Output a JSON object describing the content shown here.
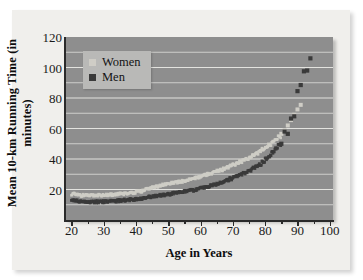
{
  "figure": {
    "background_color": "#ffffff",
    "card_color": "#f0efec",
    "panel_color": "#8e8e8e",
    "gridline_color": "#e8e8e4"
  },
  "legend": {
    "position": "upper-left-inside",
    "entries": [
      {
        "label": "Women",
        "color": "#cfcdc6",
        "marker": "square"
      },
      {
        "label": "Men",
        "color": "#3a3a3a",
        "marker": "square"
      }
    ]
  },
  "axes": {
    "y_ticklabels": [
      "120",
      "100",
      "80",
      "60",
      "40",
      "20"
    ],
    "x_ticklabels": [
      "20",
      "30",
      "40",
      "50",
      "60",
      "70",
      "80",
      "90",
      "100"
    ]
  },
  "chart_data": {
    "type": "scatter",
    "title": "",
    "subtitle": "",
    "xlabel": "Age in Years",
    "ylabel": "Mean 10-km Running Time (in minutes)",
    "xlim": [
      18,
      101
    ],
    "ylim": [
      0,
      120
    ],
    "xticks": [
      20,
      30,
      40,
      50,
      60,
      70,
      80,
      90,
      100
    ],
    "xminorticks": [
      25,
      35,
      45,
      55,
      65,
      75,
      85,
      95
    ],
    "yticks": [
      20,
      40,
      60,
      80,
      100,
      120
    ],
    "ygridlines": [
      10,
      20,
      30,
      40,
      50,
      60,
      70,
      80,
      90,
      100,
      110
    ],
    "grid": "horizontal-white",
    "legend_position": "upper left",
    "series": [
      {
        "name": "Women",
        "color": "#cfcdc6",
        "marker": "square",
        "x": [
          20,
          21,
          22,
          23,
          24,
          25,
          26,
          27,
          28,
          29,
          30,
          31,
          32,
          33,
          34,
          35,
          36,
          37,
          38,
          39,
          40,
          41,
          42,
          43,
          44,
          45,
          46,
          47,
          48,
          49,
          50,
          51,
          52,
          53,
          54,
          55,
          56,
          57,
          58,
          59,
          60,
          61,
          62,
          63,
          64,
          65,
          66,
          67,
          68,
          69,
          70,
          71,
          72,
          73,
          74,
          75,
          76,
          77,
          78,
          79,
          80,
          81,
          82,
          83,
          84,
          85,
          86,
          87,
          88,
          89,
          90,
          91
        ],
        "y": [
          17.0,
          16.6,
          16.3,
          16.2,
          16.1,
          16.0,
          16.0,
          16.1,
          16.2,
          16.2,
          16.3,
          16.4,
          16.5,
          16.7,
          16.9,
          17.0,
          17.2,
          17.4,
          17.7,
          18.0,
          18.4,
          18.9,
          19.5,
          20.1,
          20.8,
          21.5,
          22.1,
          22.6,
          23.0,
          23.4,
          23.8,
          24.2,
          24.6,
          25.0,
          25.4,
          25.8,
          26.3,
          26.9,
          27.5,
          28.1,
          28.8,
          29.4,
          30.0,
          30.6,
          31.3,
          32.0,
          32.8,
          33.7,
          34.6,
          35.6,
          36.6,
          37.5,
          38.3,
          39.2,
          40.2,
          41.3,
          42.5,
          43.8,
          45.2,
          46.6,
          48.0,
          49.5,
          51.0,
          52.6,
          54.5,
          56.5,
          59.0,
          62.0,
          65.5,
          69.0,
          72.5,
          75.5
        ]
      },
      {
        "name": "Men",
        "color": "#3a3a3a",
        "marker": "square",
        "x": [
          20,
          21,
          22,
          23,
          24,
          25,
          26,
          27,
          28,
          29,
          30,
          31,
          32,
          33,
          34,
          35,
          36,
          37,
          38,
          39,
          40,
          41,
          42,
          43,
          44,
          45,
          46,
          47,
          48,
          49,
          50,
          51,
          52,
          53,
          54,
          55,
          56,
          57,
          58,
          59,
          60,
          61,
          62,
          63,
          64,
          65,
          66,
          67,
          68,
          69,
          70,
          71,
          72,
          73,
          74,
          75,
          76,
          77,
          78,
          79,
          80,
          81,
          82,
          83,
          84,
          85,
          86,
          87,
          88,
          89,
          90,
          91,
          92,
          93,
          94
        ],
        "y": [
          13.2,
          12.7,
          12.3,
          12.0,
          11.8,
          11.7,
          11.7,
          11.8,
          11.9,
          12.0,
          12.1,
          12.2,
          12.4,
          12.5,
          12.7,
          12.8,
          13.0,
          13.1,
          13.3,
          13.5,
          13.8,
          14.1,
          14.5,
          14.9,
          15.3,
          15.6,
          15.9,
          16.2,
          16.5,
          16.8,
          17.1,
          17.4,
          17.7,
          18.0,
          18.3,
          18.7,
          19.1,
          19.5,
          19.9,
          20.4,
          20.9,
          21.4,
          21.9,
          22.5,
          23.1,
          23.8,
          24.5,
          25.3,
          26.1,
          27.0,
          27.9,
          28.8,
          29.7,
          30.6,
          31.6,
          32.7,
          33.9,
          35.2,
          36.6,
          38.2,
          40.0,
          42.0,
          44.3,
          46.8,
          49.5,
          50.0,
          58.0,
          56.5,
          66.5,
          68.0,
          84.5,
          88.5,
          97.5,
          98.0,
          106.0
        ]
      }
    ]
  }
}
